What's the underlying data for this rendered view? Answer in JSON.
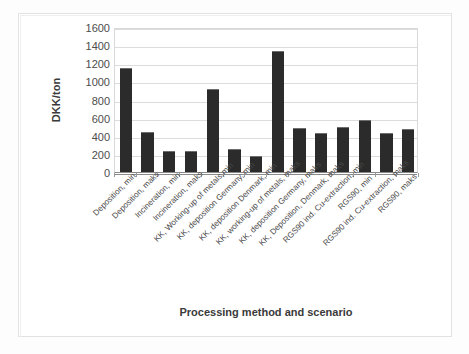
{
  "chart_data": {
    "type": "bar",
    "title": "",
    "xlabel": "Processing method and scenario",
    "ylabel": "DKK/ton",
    "ylim": [
      0,
      1600
    ],
    "ytick_step": 200,
    "yticks": [
      1600,
      1400,
      1200,
      1000,
      800,
      600,
      400,
      200,
      0
    ],
    "grid": true,
    "legend": "none",
    "bar_color": "#2b2b2b",
    "categories": [
      "Deposition, min",
      "Deposition, maks",
      "Incineration, min",
      "Incineration, maks",
      "KK, Working-up of metals,min",
      "KK, deposition Germany, min",
      "KK, deposition Denmark, min",
      "KK, working-up of metals, maks",
      "KK, deposition Germany, maks",
      "KK, Deposition, Denmark, maks",
      "RGS90 ind. Cu-extraction, min",
      "RGS90, min",
      "RGS90 ind. Cu-extraction, maks",
      "RGS90, maks"
    ],
    "values": [
      1150,
      440,
      230,
      230,
      920,
      250,
      180,
      1330,
      490,
      430,
      500,
      570,
      430,
      470
    ]
  },
  "axes": {
    "y_title": "DKK/ton",
    "x_title": "Processing method and scenario"
  }
}
